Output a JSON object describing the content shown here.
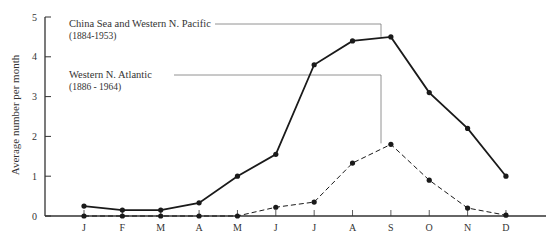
{
  "chart_data": {
    "type": "line",
    "title": "",
    "xlabel": "",
    "ylabel": "Average number per month",
    "ylim": [
      0,
      5
    ],
    "yticks": [
      0,
      1,
      2,
      3,
      4,
      5
    ],
    "grid": false,
    "categories": [
      "J",
      "F",
      "M",
      "A",
      "M",
      "J",
      "J",
      "A",
      "S",
      "O",
      "N",
      "D"
    ],
    "series": [
      {
        "name": "China Sea and Western N. Pacific",
        "period": "(1884-1953)",
        "style": "solid",
        "values": [
          0.25,
          0.15,
          0.15,
          0.33,
          1.0,
          1.55,
          3.8,
          4.4,
          4.5,
          3.1,
          2.2,
          1.0
        ]
      },
      {
        "name": "Western N. Atlantic",
        "period": "(1886 - 1964)",
        "style": "dashed",
        "values": [
          0,
          0,
          0,
          0,
          0,
          0.22,
          0.35,
          1.33,
          1.8,
          0.9,
          0.2,
          0.02
        ]
      }
    ],
    "annotations": [
      {
        "text": "China Sea and Western N. Pacific (1884-1953)",
        "points_to": "Pacific series at S"
      },
      {
        "text": "Western N. Atlantic (1886 - 1964)",
        "points_to": "Atlantic series at S"
      }
    ],
    "legend_position": "inline annotations, upper left"
  },
  "labels": {
    "ylabel": "Average number per month",
    "pacific_name": "China Sea and Western N. Pacific",
    "pacific_period": "(1884-1953)",
    "atlantic_name": "Western N. Atlantic",
    "atlantic_period": "(1886 - 1964)"
  },
  "colors": {
    "line": "#1a1a1a",
    "axis": "#333333",
    "leader": "#777777"
  }
}
